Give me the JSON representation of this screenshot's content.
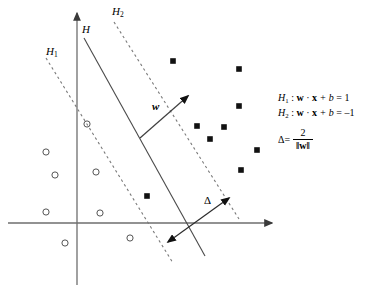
{
  "figure": {
    "background": "#ffffff",
    "ink": "#000000"
  },
  "axes": {
    "x_axis": {
      "name": "x-axis",
      "y": 223,
      "x_start": 8,
      "x_end": 278
    },
    "y_axis": {
      "name": "y-axis",
      "x": 77,
      "y_start": 8,
      "y_end": 285
    }
  },
  "hyperplanes": [
    {
      "id": "H",
      "label": "H",
      "style": "solid",
      "x1": 84,
      "y1": 38,
      "x2": 205,
      "y2": 256,
      "label_x": 82,
      "label_y": 24
    },
    {
      "id": "H1",
      "label": "H",
      "subscript": "1",
      "style": "dashed",
      "x1": 46,
      "y1": 58,
      "x2": 173,
      "y2": 263,
      "label_x": 46,
      "label_y": 46
    },
    {
      "id": "H2",
      "label": "H",
      "subscript": "2",
      "style": "dashed",
      "x1": 114,
      "y1": 22,
      "x2": 239,
      "y2": 219,
      "label_x": 112,
      "label_y": 6
    }
  ],
  "vectors": {
    "weight_vector": {
      "label": "w",
      "x1": 140,
      "y1": 138,
      "x2": 190,
      "y2": 94,
      "label_x": 152,
      "label_y": 101
    },
    "margin_arrow": {
      "label": "Δ",
      "x1": 166,
      "y1": 244,
      "x2": 231,
      "y2": 196,
      "label_x": 204,
      "label_y": 195,
      "double_headed": true
    }
  },
  "data_points": {
    "negative_class": {
      "marker": "circle-open",
      "label": "negative class sample",
      "points": [
        {
          "x": 87,
          "y": 124
        },
        {
          "x": 46,
          "y": 152
        },
        {
          "x": 55,
          "y": 175
        },
        {
          "x": 96,
          "y": 172
        },
        {
          "x": 46,
          "y": 212
        },
        {
          "x": 100,
          "y": 213
        },
        {
          "x": 65,
          "y": 243
        },
        {
          "x": 130,
          "y": 238
        }
      ]
    },
    "positive_class": {
      "marker": "square-filled",
      "label": "positive class sample",
      "points": [
        {
          "x": 173,
          "y": 61
        },
        {
          "x": 239,
          "y": 69
        },
        {
          "x": 239,
          "y": 106
        },
        {
          "x": 197,
          "y": 126
        },
        {
          "x": 224,
          "y": 127
        },
        {
          "x": 210,
          "y": 139
        },
        {
          "x": 257,
          "y": 150
        },
        {
          "x": 241,
          "y": 170
        },
        {
          "x": 147,
          "y": 196
        }
      ]
    }
  },
  "equations": {
    "h1": {
      "name": "H",
      "subscript": "1",
      "text": " : w · x + b = 1",
      "lhs": "H",
      "colon": " : ",
      "w": "w",
      "dot": " · ",
      "x": "x",
      "plus_b": " + b",
      "equals": " = ",
      "value": "1"
    },
    "h2": {
      "name": "H",
      "subscript": "2",
      "lhs": "H",
      "colon": " : ",
      "w": "w",
      "dot": " · ",
      "x": "x",
      "plus_b": " + b",
      "equals": " = ",
      "value": "–1"
    },
    "margin": {
      "symbol": "Δ",
      "equals": " = ",
      "numerator": "2",
      "denominator": "‖w‖"
    }
  }
}
